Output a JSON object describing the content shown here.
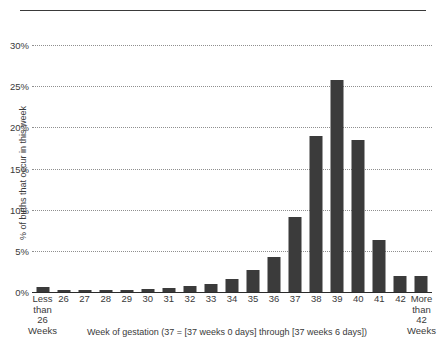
{
  "chart_data": {
    "type": "bar",
    "title": "",
    "xlabel": "Week of gestation (37 = [37 weeks 0 days] through [37 weeks 6 days])",
    "ylabel": "% of births that occur in this week",
    "categories": [
      "Less\nthan\n26 Weeks",
      "26",
      "27",
      "28",
      "29",
      "30",
      "31",
      "32",
      "33",
      "34",
      "35",
      "36",
      "37",
      "38",
      "39",
      "40",
      "41",
      "42",
      "More\nthan\n42 Weeks"
    ],
    "values": [
      0.55,
      0.15,
      0.2,
      0.25,
      0.3,
      0.4,
      0.5,
      0.7,
      1.0,
      1.6,
      2.7,
      4.3,
      9.1,
      19.0,
      25.7,
      18.5,
      6.3,
      2.0,
      2.0
    ],
    "ylim": [
      0,
      31
    ],
    "yticks": [
      0,
      5,
      10,
      15,
      20,
      25,
      30
    ],
    "ytick_labels": [
      "0%",
      "5%",
      "10%",
      "15%",
      "20%",
      "25%",
      "30%"
    ],
    "grid": true,
    "grid_style": "dotted",
    "legend": "none",
    "bar_color": "#3b3b3b",
    "gridline_color": "#8f8f8f",
    "axis_color": "#2b2b2b",
    "background_color": "#ffffff"
  },
  "decorations": {
    "top_rule": "horizontal-rule"
  }
}
